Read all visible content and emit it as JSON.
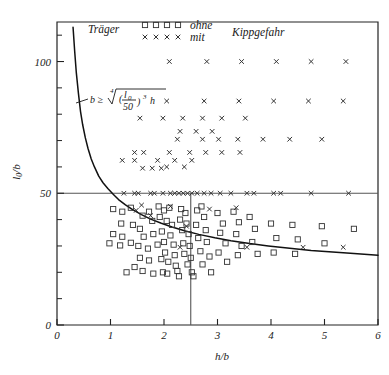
{
  "chart_data": {
    "type": "scatter",
    "title": "",
    "xlabel": "h/b",
    "ylabel": "l0/b",
    "xlim": [
      0,
      6
    ],
    "ylim": [
      0,
      115
    ],
    "x_ticks": [
      0,
      1,
      2,
      3,
      4,
      5,
      6
    ],
    "x_tick_labels": [
      "0",
      "1",
      "2",
      "3",
      "4",
      "5",
      "6"
    ],
    "y_ticks": [
      0,
      50,
      100
    ],
    "y_tick_labels": [
      "0",
      "50",
      "100"
    ],
    "y_minor_ticks": [
      10,
      20,
      30,
      40,
      60,
      70,
      80,
      90,
      110
    ],
    "grid": false,
    "legend_position": "top-left",
    "legend": {
      "prefix": "Träger",
      "suffix": "Kippgefahr",
      "entries": [
        {
          "marker": "square",
          "label": "ohne",
          "count": 4
        },
        {
          "marker": "cross",
          "label": "mit",
          "count": 4
        }
      ]
    },
    "annotations": [
      {
        "name": "design-rule-formula",
        "text": "b ≥ ⁴√((l0/50)³ h)",
        "lhs": "b ≥",
        "root_index": "4",
        "numerator": "l",
        "numerator_sub": "0",
        "denominator": "50",
        "exponent": "3",
        "trailing": "h",
        "x": 1.15,
        "y": 84
      }
    ],
    "reference_lines": [
      {
        "name": "horizontal-limit-line",
        "orientation": "horizontal",
        "value": 50,
        "x_from": 0,
        "x_to": 6
      },
      {
        "name": "vertical-limit-line",
        "orientation": "vertical",
        "value": 2.5,
        "y_from": 0,
        "y_to": 50
      }
    ],
    "curve": {
      "name": "slenderness-limit-curve",
      "label": "b ≥ ⁴√((l0/50)³ h)",
      "points": [
        [
          0.3,
          113.0
        ],
        [
          0.33,
          104.0
        ],
        [
          0.36,
          96.0
        ],
        [
          0.4,
          88.0
        ],
        [
          0.44,
          81.0
        ],
        [
          0.48,
          76.0
        ],
        [
          0.53,
          71.0
        ],
        [
          0.58,
          67.0
        ],
        [
          0.64,
          63.0
        ],
        [
          0.7,
          60.0
        ],
        [
          0.78,
          56.5
        ],
        [
          0.86,
          54.0
        ],
        [
          0.95,
          51.8
        ],
        [
          1.05,
          49.6
        ],
        [
          1.15,
          47.6
        ],
        [
          1.28,
          45.6
        ],
        [
          1.42,
          43.7
        ],
        [
          1.58,
          41.9
        ],
        [
          1.75,
          40.2
        ],
        [
          1.95,
          38.6
        ],
        [
          2.15,
          37.2
        ],
        [
          2.4,
          35.7
        ],
        [
          2.65,
          34.4
        ],
        [
          2.95,
          33.1
        ],
        [
          3.25,
          32.0
        ],
        [
          3.6,
          30.9
        ],
        [
          3.95,
          30.0
        ],
        [
          4.35,
          29.1
        ],
        [
          4.75,
          28.3
        ],
        [
          5.15,
          27.7
        ],
        [
          5.55,
          27.1
        ],
        [
          6.0,
          26.5
        ]
      ]
    },
    "series": [
      {
        "name": "ohne Kippgefahr",
        "marker": "square",
        "label": "ohne",
        "points": [
          [
            1.05,
            44.0
          ],
          [
            1.22,
            43.0
          ],
          [
            1.38,
            44.5
          ],
          [
            1.2,
            38.5
          ],
          [
            1.42,
            38.0
          ],
          [
            1.05,
            34.5
          ],
          [
            1.22,
            33.5
          ],
          [
            0.98,
            31.0
          ],
          [
            1.18,
            30.2
          ],
          [
            1.38,
            31.2
          ],
          [
            1.55,
            36.5
          ],
          [
            1.6,
            41.5
          ],
          [
            1.72,
            43.0
          ],
          [
            1.78,
            39.5
          ],
          [
            1.62,
            33.5
          ],
          [
            1.8,
            34.5
          ],
          [
            1.52,
            30.0
          ],
          [
            1.7,
            29.0
          ],
          [
            1.88,
            30.5
          ],
          [
            1.55,
            25.5
          ],
          [
            1.72,
            24.5
          ],
          [
            1.95,
            25.0
          ],
          [
            1.6,
            20.5
          ],
          [
            1.8,
            19.5
          ],
          [
            1.98,
            20.0
          ],
          [
            2.0,
            43.5
          ],
          [
            2.1,
            44.5
          ],
          [
            1.92,
            41.0
          ],
          [
            2.05,
            39.5
          ],
          [
            2.15,
            38.0
          ],
          [
            1.96,
            35.5
          ],
          [
            2.12,
            34.0
          ],
          [
            2.0,
            31.5
          ],
          [
            2.18,
            30.5
          ],
          [
            2.02,
            27.5
          ],
          [
            2.2,
            26.5
          ],
          [
            2.08,
            24.0
          ],
          [
            2.22,
            22.5
          ],
          [
            2.06,
            19.5
          ],
          [
            2.25,
            20.5
          ],
          [
            2.32,
            44.0
          ],
          [
            2.4,
            42.5
          ],
          [
            2.3,
            40.0
          ],
          [
            2.42,
            38.5
          ],
          [
            2.34,
            36.0
          ],
          [
            2.46,
            34.5
          ],
          [
            2.36,
            31.0
          ],
          [
            2.48,
            30.0
          ],
          [
            2.38,
            27.0
          ],
          [
            2.5,
            25.5
          ],
          [
            2.44,
            23.0
          ],
          [
            2.52,
            20.0
          ],
          [
            2.62,
            43.5
          ],
          [
            2.75,
            41.0
          ],
          [
            2.6,
            38.0
          ],
          [
            2.78,
            36.0
          ],
          [
            2.64,
            33.0
          ],
          [
            2.8,
            31.5
          ],
          [
            2.68,
            28.0
          ],
          [
            2.85,
            26.0
          ],
          [
            2.72,
            23.0
          ],
          [
            2.88,
            20.0
          ],
          [
            3.0,
            42.5
          ],
          [
            3.1,
            38.5
          ],
          [
            3.05,
            35.0
          ],
          [
            3.15,
            31.0
          ],
          [
            3.02,
            27.5
          ],
          [
            3.18,
            24.0
          ],
          [
            3.3,
            43.0
          ],
          [
            3.4,
            39.0
          ],
          [
            3.35,
            34.5
          ],
          [
            3.45,
            30.0
          ],
          [
            3.38,
            26.5
          ],
          [
            3.6,
            41.0
          ],
          [
            3.7,
            36.5
          ],
          [
            3.65,
            31.5
          ],
          [
            3.75,
            27.0
          ],
          [
            4.0,
            38.5
          ],
          [
            4.1,
            33.0
          ],
          [
            4.05,
            27.5
          ],
          [
            4.4,
            38.0
          ],
          [
            4.5,
            32.5
          ],
          [
            4.45,
            27.0
          ],
          [
            4.95,
            37.5
          ],
          [
            5.0,
            31.0
          ],
          [
            5.55,
            36.5
          ],
          [
            1.3,
            20.0
          ],
          [
            1.45,
            22.0
          ],
          [
            2.28,
            18.5
          ],
          [
            2.55,
            18.5
          ],
          [
            1.9,
            45.0
          ],
          [
            2.7,
            45.0
          ]
        ]
      },
      {
        "name": "mit Kippgefahr",
        "marker": "cross",
        "label": "mit",
        "points": [
          [
            2.1,
            100.0
          ],
          [
            2.8,
            100.0
          ],
          [
            3.45,
            100.0
          ],
          [
            4.1,
            100.0
          ],
          [
            4.75,
            100.0
          ],
          [
            5.4,
            100.0
          ],
          [
            2.05,
            85.0
          ],
          [
            2.75,
            85.0
          ],
          [
            3.4,
            85.0
          ],
          [
            4.05,
            85.0
          ],
          [
            4.7,
            85.0
          ],
          [
            5.35,
            85.0
          ],
          [
            1.55,
            78.5
          ],
          [
            1.98,
            78.5
          ],
          [
            2.35,
            78.5
          ],
          [
            2.72,
            78.5
          ],
          [
            3.08,
            78.5
          ],
          [
            3.52,
            78.5
          ],
          [
            2.3,
            73.5
          ],
          [
            2.6,
            73.5
          ],
          [
            2.9,
            73.5
          ],
          [
            2.25,
            70.5
          ],
          [
            2.72,
            70.5
          ],
          [
            3.02,
            70.5
          ],
          [
            3.38,
            70.5
          ],
          [
            3.85,
            70.5
          ],
          [
            4.35,
            70.5
          ],
          [
            4.95,
            70.5
          ],
          [
            1.45,
            65.5
          ],
          [
            1.62,
            65.5
          ],
          [
            2.1,
            65.5
          ],
          [
            2.48,
            65.5
          ],
          [
            2.78,
            65.5
          ],
          [
            3.08,
            65.5
          ],
          [
            3.42,
            65.5
          ],
          [
            1.22,
            62.5
          ],
          [
            1.45,
            62.5
          ],
          [
            1.88,
            62.5
          ],
          [
            2.2,
            62.5
          ],
          [
            2.52,
            62.5
          ],
          [
            2.05,
            60.0
          ],
          [
            2.38,
            60.0
          ],
          [
            1.6,
            59.5
          ],
          [
            1.78,
            59.5
          ],
          [
            1.95,
            59.5
          ],
          [
            1.25,
            50.0
          ],
          [
            1.45,
            50.0
          ],
          [
            1.52,
            50.0
          ],
          [
            1.75,
            50.0
          ],
          [
            1.82,
            50.0
          ],
          [
            1.98,
            50.0
          ],
          [
            2.12,
            50.0
          ],
          [
            2.2,
            50.0
          ],
          [
            2.28,
            50.0
          ],
          [
            2.36,
            50.0
          ],
          [
            2.44,
            50.0
          ],
          [
            2.52,
            50.0
          ],
          [
            2.62,
            50.0
          ],
          [
            2.75,
            50.0
          ],
          [
            2.88,
            50.0
          ],
          [
            3.05,
            50.0
          ],
          [
            3.25,
            50.0
          ],
          [
            3.55,
            50.0
          ],
          [
            3.68,
            50.0
          ],
          [
            4.05,
            50.0
          ],
          [
            4.18,
            50.0
          ],
          [
            4.75,
            50.0
          ],
          [
            5.45,
            50.0
          ],
          [
            1.48,
            43.5
          ],
          [
            2.12,
            45.0
          ],
          [
            2.85,
            44.0
          ],
          [
            3.35,
            44.5
          ],
          [
            2.42,
            37.5
          ],
          [
            1.75,
            41.5
          ],
          [
            2.3,
            29.5
          ],
          [
            3.55,
            29.5
          ],
          [
            4.6,
            29.5
          ],
          [
            5.35,
            29.5
          ],
          [
            1.58,
            45.5
          ]
        ]
      }
    ]
  },
  "colors": {
    "axis": "#222222",
    "marker": "#333333",
    "curve": "#111111",
    "reference_line": "#555555",
    "background": "#ffffff"
  }
}
